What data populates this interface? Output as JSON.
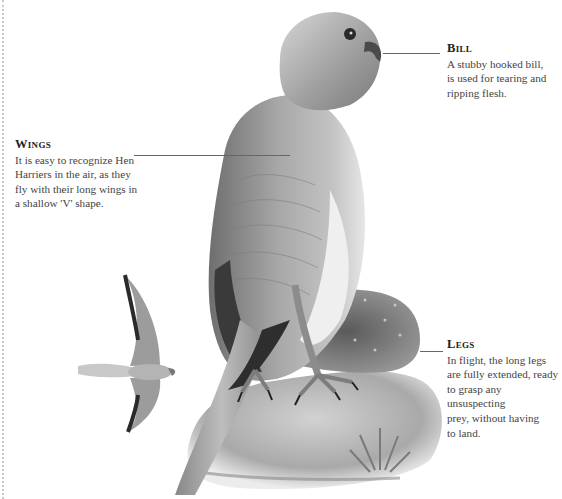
{
  "page": {
    "subject": "Hen Harrier",
    "border_color": "#c9c9c9",
    "text_color": "#333333"
  },
  "callouts": {
    "bill": {
      "heading": "Bill",
      "body": "A stubby hooked bill, is used for tearing and ripping flesh.",
      "lines": [
        "A stubby hooked bill,",
        "is used for tearing and",
        "ripping flesh."
      ]
    },
    "wings": {
      "heading": "Wings",
      "body": "It is easy to recognize Hen Harriers in the air, as they fly with their long wings in a shallow 'V' shape.",
      "lines": [
        "It is easy to recognize Hen",
        "Harriers in the air, as they",
        "fly with their long wings in",
        "a shallow 'V' shape."
      ]
    },
    "legs": {
      "heading": "Legs",
      "body": "In flight, the long legs are fully extended, ready to grasp any unsuspecting prey, without having to land.",
      "lines": [
        "In flight, the long legs",
        "are fully extended, ready",
        "to grasp any unsuspecting",
        "prey, without having",
        "to land."
      ]
    }
  },
  "illustrations": {
    "main": "perched-hen-harrier",
    "inset": "hen-harrier-in-flight",
    "ground": "rock-with-heather"
  }
}
